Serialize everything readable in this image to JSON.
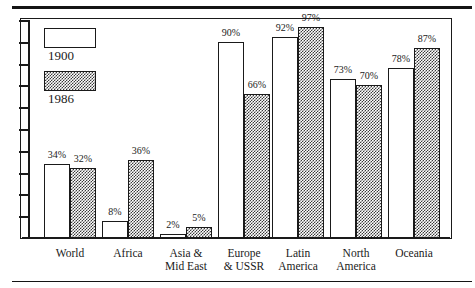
{
  "chart_data": {
    "type": "bar",
    "title": "",
    "subtitle": "",
    "xlabel": "",
    "ylabel": "",
    "ylim": [
      0,
      100
    ],
    "grid": false,
    "legend_position": "top-left",
    "categories": [
      "World",
      "Africa",
      "Asia &\nMid East",
      "Europe\n& USSR",
      "Latin\nAmerica",
      "North\nAmerica",
      "Oceania"
    ],
    "series": [
      {
        "name": "1900",
        "values": [
          34,
          8,
          2,
          90,
          92,
          73,
          78
        ],
        "data_labels": [
          "34%",
          "8%",
          "2%",
          "90%",
          "92%",
          "73%",
          "78%"
        ],
        "fill": "white"
      },
      {
        "name": "1986",
        "values": [
          32,
          36,
          5,
          66,
          97,
          70,
          87
        ],
        "data_labels": [
          "32%",
          "36%",
          "5%",
          "66%",
          "97%",
          "70%",
          "87%"
        ],
        "fill": "checker-pattern"
      }
    ],
    "yticks": [
      10,
      20,
      30,
      40,
      50,
      60,
      70,
      80,
      90,
      100
    ],
    "ytick_labels": []
  },
  "legend": {
    "items": [
      {
        "label": "1900",
        "swatch": "white-box"
      },
      {
        "label": "1986",
        "swatch": "checkered-box"
      }
    ]
  },
  "colors": {
    "ink": "#1a1a1a",
    "background": "#ffffff",
    "pattern": "#3a3a3a"
  }
}
